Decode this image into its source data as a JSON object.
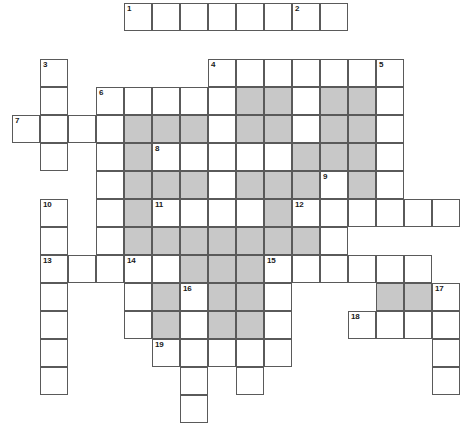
{
  "puzzle": {
    "title": "Crossword Grid",
    "type": "crossword",
    "grid": {
      "origin_x": 12,
      "origin_y": 3,
      "cell_size": 28,
      "columns": 16,
      "rows": 15,
      "line_color": "#5a5a5a",
      "cell_color": "#ffffff",
      "shaded_color": "#c8c8c8",
      "number_color": "#1a1a1a"
    },
    "clue_numbers": [
      {
        "n": "1",
        "col": 4,
        "row": 0
      },
      {
        "n": "2",
        "col": 10,
        "row": 0
      },
      {
        "n": "3",
        "col": 1,
        "row": 2
      },
      {
        "n": "4",
        "col": 7,
        "row": 2
      },
      {
        "n": "5",
        "col": 13,
        "row": 2
      },
      {
        "n": "6",
        "col": 3,
        "row": 3
      },
      {
        "n": "7",
        "col": 0,
        "row": 4
      },
      {
        "n": "8",
        "col": 5,
        "row": 5
      },
      {
        "n": "9",
        "col": 11,
        "row": 6
      },
      {
        "n": "10",
        "col": 1,
        "row": 7
      },
      {
        "n": "11",
        "col": 5,
        "row": 7
      },
      {
        "n": "12",
        "col": 10,
        "row": 7
      },
      {
        "n": "13",
        "col": 1,
        "row": 9
      },
      {
        "n": "14",
        "col": 4,
        "row": 9
      },
      {
        "n": "15",
        "col": 9,
        "row": 9
      },
      {
        "n": "16",
        "col": 6,
        "row": 10
      },
      {
        "n": "17",
        "col": 15,
        "row": 10
      },
      {
        "n": "18",
        "col": 12,
        "row": 11
      },
      {
        "n": "19",
        "col": 5,
        "row": 12
      }
    ],
    "cells": [
      {
        "col": 4,
        "row": 0,
        "shaded": false,
        "num": "1"
      },
      {
        "col": 5,
        "row": 0,
        "shaded": false
      },
      {
        "col": 6,
        "row": 0,
        "shaded": false
      },
      {
        "col": 7,
        "row": 0,
        "shaded": false
      },
      {
        "col": 8,
        "row": 0,
        "shaded": false
      },
      {
        "col": 9,
        "row": 0,
        "shaded": false
      },
      {
        "col": 10,
        "row": 0,
        "shaded": false,
        "num": "2"
      },
      {
        "col": 11,
        "row": 0,
        "shaded": false
      },
      {
        "col": 1,
        "row": 2,
        "shaded": false,
        "num": "3"
      },
      {
        "col": 7,
        "row": 2,
        "shaded": false,
        "num": "4"
      },
      {
        "col": 8,
        "row": 2,
        "shaded": false
      },
      {
        "col": 9,
        "row": 2,
        "shaded": false
      },
      {
        "col": 10,
        "row": 2,
        "shaded": false
      },
      {
        "col": 11,
        "row": 2,
        "shaded": false
      },
      {
        "col": 12,
        "row": 2,
        "shaded": false
      },
      {
        "col": 13,
        "row": 2,
        "shaded": false,
        "num": "5"
      },
      {
        "col": 1,
        "row": 3,
        "shaded": false
      },
      {
        "col": 3,
        "row": 3,
        "shaded": false,
        "num": "6"
      },
      {
        "col": 4,
        "row": 3,
        "shaded": false
      },
      {
        "col": 5,
        "row": 3,
        "shaded": false
      },
      {
        "col": 6,
        "row": 3,
        "shaded": false
      },
      {
        "col": 7,
        "row": 3,
        "shaded": false
      },
      {
        "col": 8,
        "row": 3,
        "shaded": true
      },
      {
        "col": 9,
        "row": 3,
        "shaded": true
      },
      {
        "col": 10,
        "row": 3,
        "shaded": false
      },
      {
        "col": 11,
        "row": 3,
        "shaded": true
      },
      {
        "col": 12,
        "row": 3,
        "shaded": true
      },
      {
        "col": 13,
        "row": 3,
        "shaded": false
      },
      {
        "col": 0,
        "row": 4,
        "shaded": false,
        "num": "7"
      },
      {
        "col": 1,
        "row": 4,
        "shaded": false
      },
      {
        "col": 2,
        "row": 4,
        "shaded": false
      },
      {
        "col": 3,
        "row": 4,
        "shaded": false
      },
      {
        "col": 4,
        "row": 4,
        "shaded": true
      },
      {
        "col": 5,
        "row": 4,
        "shaded": true
      },
      {
        "col": 6,
        "row": 4,
        "shaded": true
      },
      {
        "col": 7,
        "row": 4,
        "shaded": false
      },
      {
        "col": 8,
        "row": 4,
        "shaded": true
      },
      {
        "col": 9,
        "row": 4,
        "shaded": true
      },
      {
        "col": 10,
        "row": 4,
        "shaded": false
      },
      {
        "col": 11,
        "row": 4,
        "shaded": true
      },
      {
        "col": 12,
        "row": 4,
        "shaded": true
      },
      {
        "col": 13,
        "row": 4,
        "shaded": false
      },
      {
        "col": 1,
        "row": 5,
        "shaded": false
      },
      {
        "col": 3,
        "row": 5,
        "shaded": false
      },
      {
        "col": 4,
        "row": 5,
        "shaded": true
      },
      {
        "col": 5,
        "row": 5,
        "shaded": false,
        "num": "8"
      },
      {
        "col": 6,
        "row": 5,
        "shaded": false
      },
      {
        "col": 7,
        "row": 5,
        "shaded": false
      },
      {
        "col": 8,
        "row": 5,
        "shaded": false
      },
      {
        "col": 9,
        "row": 5,
        "shaded": false
      },
      {
        "col": 10,
        "row": 5,
        "shaded": true
      },
      {
        "col": 11,
        "row": 5,
        "shaded": true
      },
      {
        "col": 12,
        "row": 5,
        "shaded": true
      },
      {
        "col": 13,
        "row": 5,
        "shaded": false
      },
      {
        "col": 3,
        "row": 6,
        "shaded": false
      },
      {
        "col": 4,
        "row": 6,
        "shaded": true
      },
      {
        "col": 5,
        "row": 6,
        "shaded": true
      },
      {
        "col": 6,
        "row": 6,
        "shaded": true
      },
      {
        "col": 7,
        "row": 6,
        "shaded": false
      },
      {
        "col": 8,
        "row": 6,
        "shaded": true
      },
      {
        "col": 9,
        "row": 6,
        "shaded": true
      },
      {
        "col": 10,
        "row": 6,
        "shaded": true
      },
      {
        "col": 11,
        "row": 6,
        "shaded": false,
        "num": "9"
      },
      {
        "col": 12,
        "row": 6,
        "shaded": true
      },
      {
        "col": 13,
        "row": 6,
        "shaded": false
      },
      {
        "col": 1,
        "row": 7,
        "shaded": false,
        "num": "10"
      },
      {
        "col": 3,
        "row": 7,
        "shaded": false
      },
      {
        "col": 4,
        "row": 7,
        "shaded": true
      },
      {
        "col": 5,
        "row": 7,
        "shaded": false,
        "num": "11"
      },
      {
        "col": 6,
        "row": 7,
        "shaded": false
      },
      {
        "col": 7,
        "row": 7,
        "shaded": false
      },
      {
        "col": 8,
        "row": 7,
        "shaded": false
      },
      {
        "col": 9,
        "row": 7,
        "shaded": true
      },
      {
        "col": 10,
        "row": 7,
        "shaded": false,
        "num": "12"
      },
      {
        "col": 11,
        "row": 7,
        "shaded": false
      },
      {
        "col": 12,
        "row": 7,
        "shaded": false
      },
      {
        "col": 13,
        "row": 7,
        "shaded": false
      },
      {
        "col": 14,
        "row": 7,
        "shaded": false
      },
      {
        "col": 15,
        "row": 7,
        "shaded": false
      },
      {
        "col": 1,
        "row": 8,
        "shaded": false
      },
      {
        "col": 3,
        "row": 8,
        "shaded": false
      },
      {
        "col": 4,
        "row": 8,
        "shaded": true
      },
      {
        "col": 5,
        "row": 8,
        "shaded": true
      },
      {
        "col": 6,
        "row": 8,
        "shaded": true
      },
      {
        "col": 7,
        "row": 8,
        "shaded": true
      },
      {
        "col": 8,
        "row": 8,
        "shaded": true
      },
      {
        "col": 9,
        "row": 8,
        "shaded": true
      },
      {
        "col": 10,
        "row": 8,
        "shaded": true
      },
      {
        "col": 11,
        "row": 8,
        "shaded": false
      },
      {
        "col": 1,
        "row": 9,
        "shaded": false,
        "num": "13"
      },
      {
        "col": 2,
        "row": 9,
        "shaded": false
      },
      {
        "col": 3,
        "row": 9,
        "shaded": false
      },
      {
        "col": 4,
        "row": 9,
        "shaded": false,
        "num": "14"
      },
      {
        "col": 5,
        "row": 9,
        "shaded": false
      },
      {
        "col": 6,
        "row": 9,
        "shaded": true
      },
      {
        "col": 7,
        "row": 9,
        "shaded": true
      },
      {
        "col": 8,
        "row": 9,
        "shaded": true
      },
      {
        "col": 9,
        "row": 9,
        "shaded": false,
        "num": "15"
      },
      {
        "col": 10,
        "row": 9,
        "shaded": false
      },
      {
        "col": 11,
        "row": 9,
        "shaded": false
      },
      {
        "col": 12,
        "row": 9,
        "shaded": false
      },
      {
        "col": 13,
        "row": 9,
        "shaded": false
      },
      {
        "col": 14,
        "row": 9,
        "shaded": false
      },
      {
        "col": 1,
        "row": 10,
        "shaded": false
      },
      {
        "col": 4,
        "row": 10,
        "shaded": false
      },
      {
        "col": 5,
        "row": 10,
        "shaded": true
      },
      {
        "col": 6,
        "row": 10,
        "shaded": false,
        "num": "16"
      },
      {
        "col": 7,
        "row": 10,
        "shaded": true
      },
      {
        "col": 8,
        "row": 10,
        "shaded": true
      },
      {
        "col": 9,
        "row": 10,
        "shaded": false
      },
      {
        "col": 13,
        "row": 10,
        "shaded": true
      },
      {
        "col": 14,
        "row": 10,
        "shaded": true
      },
      {
        "col": 15,
        "row": 10,
        "shaded": false,
        "num": "17"
      },
      {
        "col": 1,
        "row": 11,
        "shaded": false
      },
      {
        "col": 4,
        "row": 11,
        "shaded": false
      },
      {
        "col": 5,
        "row": 11,
        "shaded": true
      },
      {
        "col": 6,
        "row": 11,
        "shaded": false
      },
      {
        "col": 7,
        "row": 11,
        "shaded": true
      },
      {
        "col": 8,
        "row": 11,
        "shaded": true
      },
      {
        "col": 9,
        "row": 11,
        "shaded": false
      },
      {
        "col": 12,
        "row": 11,
        "shaded": false,
        "num": "18"
      },
      {
        "col": 13,
        "row": 11,
        "shaded": false
      },
      {
        "col": 14,
        "row": 11,
        "shaded": false
      },
      {
        "col": 15,
        "row": 11,
        "shaded": false
      },
      {
        "col": 1,
        "row": 12,
        "shaded": false
      },
      {
        "col": 5,
        "row": 12,
        "shaded": false,
        "num": "19"
      },
      {
        "col": 6,
        "row": 12,
        "shaded": false
      },
      {
        "col": 7,
        "row": 12,
        "shaded": false
      },
      {
        "col": 8,
        "row": 12,
        "shaded": false
      },
      {
        "col": 9,
        "row": 12,
        "shaded": false
      },
      {
        "col": 15,
        "row": 12,
        "shaded": false
      },
      {
        "col": 1,
        "row": 13,
        "shaded": false
      },
      {
        "col": 6,
        "row": 13,
        "shaded": false
      },
      {
        "col": 8,
        "row": 13,
        "shaded": false
      },
      {
        "col": 15,
        "row": 13,
        "shaded": false
      },
      {
        "col": 6,
        "row": 14,
        "shaded": false
      }
    ]
  }
}
